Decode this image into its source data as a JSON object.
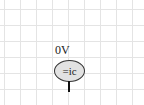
{
  "schematic": {
    "node_voltage_label": "0V",
    "probe_label": "=ic",
    "colors": {
      "grid": "#e4e4e4",
      "probe_fill": "#e2e2e2",
      "wire": "#111111"
    }
  }
}
